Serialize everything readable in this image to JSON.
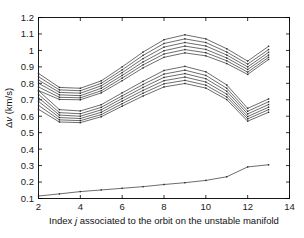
{
  "chart_data": {
    "type": "line",
    "title": "",
    "xlabel": "Index j associated to the orbit on the unstable manifold",
    "xlabel_parts": {
      "pre": "Index ",
      "italic": "j",
      "post": " associated to the orbit on the unstable manifold"
    },
    "ylabel": "Δv (km/s)",
    "ylabel_parts": {
      "delta": "Δ",
      "italic": "v",
      "post": " (km/s)"
    },
    "xlim": [
      2,
      14
    ],
    "ylim": [
      0.1,
      1.2
    ],
    "xticks": [
      2,
      4,
      6,
      8,
      10,
      12,
      14
    ],
    "xtick_labels": [
      "2",
      "4",
      "6",
      "8",
      "10",
      "12",
      "14"
    ],
    "yticks": [
      0.1,
      0.2,
      0.3,
      0.4,
      0.5,
      0.6,
      0.7,
      0.8,
      0.9,
      1.0,
      1.1,
      1.2
    ],
    "ytick_labels": [
      "0.1",
      "0.2",
      "0.3",
      "0.4",
      "0.5",
      "0.6",
      "0.7",
      "0.8",
      "0.9",
      "1",
      "1.1",
      "1.2"
    ],
    "grid": false,
    "legend": "none",
    "line_color": "#3c3c3c",
    "marker": "dot",
    "x": [
      2,
      3,
      4,
      5,
      6,
      7,
      8,
      9,
      10,
      11,
      12,
      13
    ],
    "series": [
      {
        "name": "upper-bundle-1",
        "group": "upper",
        "values": [
          0.86,
          0.775,
          0.77,
          0.815,
          0.9,
          0.99,
          1.065,
          1.095,
          1.07,
          1.01,
          0.935,
          1.025
        ]
      },
      {
        "name": "upper-bundle-2",
        "group": "upper",
        "values": [
          0.84,
          0.76,
          0.755,
          0.8,
          0.882,
          0.97,
          1.042,
          1.07,
          1.048,
          0.99,
          0.917,
          1.005
        ]
      },
      {
        "name": "upper-bundle-3",
        "group": "upper",
        "values": [
          0.82,
          0.745,
          0.74,
          0.785,
          0.865,
          0.95,
          1.02,
          1.048,
          1.027,
          0.972,
          0.9,
          0.988
        ]
      },
      {
        "name": "upper-bundle-4",
        "group": "upper",
        "values": [
          0.8,
          0.73,
          0.725,
          0.77,
          0.848,
          0.93,
          0.998,
          1.026,
          1.006,
          0.954,
          0.884,
          0.972
        ]
      },
      {
        "name": "upper-bundle-5",
        "group": "upper",
        "values": [
          0.778,
          0.715,
          0.712,
          0.755,
          0.832,
          0.912,
          0.978,
          1.005,
          0.986,
          0.937,
          0.868,
          0.958
        ]
      },
      {
        "name": "upper-bundle-6",
        "group": "upper",
        "values": [
          0.756,
          0.702,
          0.7,
          0.742,
          0.816,
          0.894,
          0.958,
          0.985,
          0.967,
          0.92,
          0.854,
          0.945
        ]
      },
      {
        "name": "lower-bundle-1",
        "group": "lower",
        "values": [
          0.755,
          0.64,
          0.632,
          0.67,
          0.742,
          0.812,
          0.878,
          0.903,
          0.87,
          0.79,
          0.648,
          0.705
        ]
      },
      {
        "name": "lower-bundle-2",
        "group": "lower",
        "values": [
          0.733,
          0.622,
          0.615,
          0.654,
          0.724,
          0.793,
          0.856,
          0.88,
          0.848,
          0.77,
          0.63,
          0.688
        ]
      },
      {
        "name": "lower-bundle-3",
        "group": "lower",
        "values": [
          0.712,
          0.607,
          0.6,
          0.639,
          0.708,
          0.775,
          0.836,
          0.859,
          0.828,
          0.752,
          0.614,
          0.671
        ]
      },
      {
        "name": "lower-bundle-4",
        "group": "lower",
        "values": [
          0.69,
          0.592,
          0.586,
          0.624,
          0.692,
          0.757,
          0.816,
          0.838,
          0.808,
          0.734,
          0.598,
          0.655
        ]
      },
      {
        "name": "lower-bundle-5",
        "group": "lower",
        "values": [
          0.666,
          0.578,
          0.573,
          0.61,
          0.676,
          0.74,
          0.797,
          0.818,
          0.789,
          0.717,
          0.584,
          0.64
        ]
      },
      {
        "name": "lower-bundle-6",
        "group": "lower",
        "values": [
          0.642,
          0.565,
          0.561,
          0.597,
          0.661,
          0.723,
          0.778,
          0.799,
          0.771,
          0.701,
          0.57,
          0.624
        ]
      },
      {
        "name": "baseline-curve",
        "group": "baseline",
        "values": [
          0.115,
          0.128,
          0.142,
          0.152,
          0.162,
          0.172,
          0.185,
          0.196,
          0.21,
          0.232,
          0.292,
          0.305
        ]
      }
    ]
  }
}
